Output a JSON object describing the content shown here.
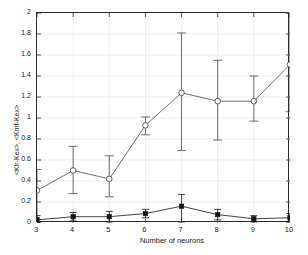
{
  "chart_data": {
    "type": "line",
    "title": "",
    "subtitle": "",
    "xlabel": "Number of neurons",
    "ylabel": "<Klr-Kex>, <Kmf-Kex>",
    "x": [
      3,
      4,
      5,
      6,
      7,
      8,
      9,
      10
    ],
    "xlim": [
      3,
      10
    ],
    "ylim": [
      0,
      2
    ],
    "xticks": [
      3,
      4,
      5,
      6,
      7,
      8,
      9,
      10
    ],
    "xticklabels": [
      "3",
      "4",
      "5",
      "6",
      "7",
      "8",
      "9",
      "10"
    ],
    "yticks": [
      0,
      0.2,
      0.4,
      0.6,
      0.8,
      1,
      1.2,
      1.4,
      1.6,
      1.8,
      2
    ],
    "yticklabels": [
      "0",
      "0.2",
      "0.4",
      "0.6",
      "0.8",
      "1",
      "1.2",
      "1.4",
      "1.6",
      "1.8",
      "2"
    ],
    "grid": true,
    "grid_color": "#e2e2e2",
    "legend": false,
    "legend_position": "none",
    "axis_color": "#2b2b2b",
    "series": [
      {
        "name": "<Klr-Kex>",
        "marker": "open-circle",
        "color": "#4a4a4a",
        "values": [
          0.31,
          0.5,
          0.42,
          0.93,
          1.24,
          1.16,
          1.16,
          1.51
        ],
        "err_low": [
          0.31,
          0.22,
          0.17,
          0.09,
          0.55,
          0.37,
          0.19,
          0.45
        ],
        "err_high": [
          0.2,
          0.23,
          0.22,
          0.08,
          0.57,
          0.39,
          0.24,
          0.49
        ]
      },
      {
        "name": "<Kmf-Kex>",
        "marker": "filled-square",
        "color": "#141414",
        "values": [
          0.03,
          0.06,
          0.06,
          0.09,
          0.16,
          0.08,
          0.04,
          0.05
        ],
        "err_low": [
          0.03,
          0.04,
          0.05,
          0.04,
          0.15,
          0.05,
          0.03,
          0.04
        ],
        "err_high": [
          0.04,
          0.04,
          0.05,
          0.04,
          0.11,
          0.05,
          0.03,
          0.04
        ]
      }
    ]
  }
}
